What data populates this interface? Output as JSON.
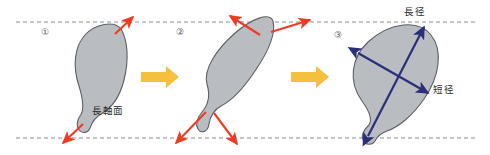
{
  "figure": {
    "type": "diagram",
    "title": "",
    "background": "#ffffff",
    "width": 490,
    "height": 155,
    "guides": {
      "name": "horizontal-dashed-guides",
      "style": "dashed",
      "color": "#8a8a96",
      "top_y": 22,
      "bottom_y": 138
    },
    "colors": {
      "shape_fill": "#b9bcc0",
      "shape_stroke": "#5d5f63",
      "rotation_arrow": "#ef3b24",
      "measure_arrow": "#2a2f7a",
      "transition_arrow": "#f5c03e",
      "guide_line": "#8a8a96",
      "text": "#2b2b2b"
    },
    "panels": [
      {
        "id": "panel-1",
        "step_marker": "①",
        "label": "長軸面",
        "label_role": "long-axis-plane",
        "arrow_color": "rotation_arrow",
        "arrow_count": 2,
        "description": "tilted specimen with two opposing red rotation arrows"
      },
      {
        "id": "panel-2",
        "step_marker": "②",
        "label": "",
        "arrow_color": "rotation_arrow",
        "arrow_count": 4,
        "description": "re-oriented specimen with four red arrows spreading at both poles"
      },
      {
        "id": "panel-3",
        "step_marker": "③",
        "labels": [
          {
            "text": "長径",
            "role": "major-diameter"
          },
          {
            "text": "短径",
            "role": "minor-diameter"
          }
        ],
        "arrow_color": "measure_arrow",
        "arrow_count": 2,
        "description": "specimen with navy double-headed major and minor diameter axes"
      }
    ],
    "transitions": [
      {
        "id": "transition-1-2",
        "from": "panel-1",
        "to": "panel-2",
        "glyph": "→"
      },
      {
        "id": "transition-2-3",
        "from": "panel-2",
        "to": "panel-3",
        "glyph": "→"
      }
    ]
  }
}
